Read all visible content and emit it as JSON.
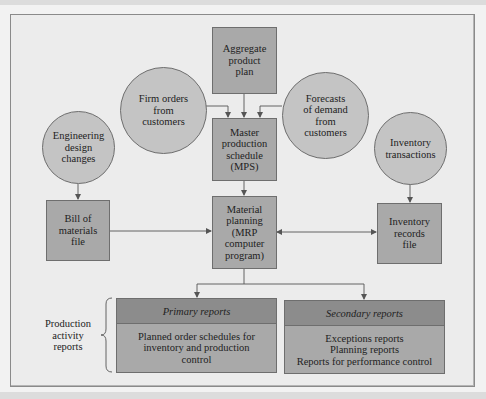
{
  "diagram": {
    "nodes": {
      "aggregate_plan": {
        "label": "Aggregate\nproduct\nplan",
        "shape": "rectangle"
      },
      "firm_orders": {
        "label": "Firm orders\nfrom\ncustomers",
        "shape": "circle"
      },
      "forecasts": {
        "label": "Forecasts\nof demand\nfrom\ncustomers",
        "shape": "circle"
      },
      "mps": {
        "label": "Master\nproduction\nschedule\n(MPS)",
        "shape": "rectangle"
      },
      "engineering_changes": {
        "label": "Engineering\ndesign\nchanges",
        "shape": "circle"
      },
      "inventory_transactions": {
        "label": "Inventory\ntransactions",
        "shape": "circle"
      },
      "bill_of_materials": {
        "label": "Bill of\nmaterials\nfile",
        "shape": "rectangle"
      },
      "material_planning": {
        "label": "Material\nplanning\n(MRP\ncomputer\nprogram)",
        "shape": "rectangle"
      },
      "inventory_records": {
        "label": "Inventory\nrecords\nfile",
        "shape": "rectangle"
      }
    },
    "reports": {
      "group_label": "Production\nactivity\nreports",
      "primary": {
        "title": "Primary reports",
        "body": "Planned order schedules for\ninventory and production\ncontrol"
      },
      "secondary": {
        "title": "Secondary reports",
        "body": "Exceptions reports\nPlanning reports\nReports for performance control"
      }
    },
    "edges": [
      {
        "from": "aggregate_plan",
        "to": "mps"
      },
      {
        "from": "firm_orders",
        "to": "mps"
      },
      {
        "from": "forecasts",
        "to": "mps"
      },
      {
        "from": "mps",
        "to": "material_planning"
      },
      {
        "from": "engineering_changes",
        "to": "bill_of_materials"
      },
      {
        "from": "bill_of_materials",
        "to": "material_planning"
      },
      {
        "from": "inventory_transactions",
        "to": "inventory_records"
      },
      {
        "from": "material_planning",
        "to": "inventory_records",
        "bidirectional": true
      },
      {
        "from": "material_planning",
        "to": "primary_reports"
      },
      {
        "from": "material_planning",
        "to": "secondary_reports"
      }
    ],
    "colors": {
      "box_fill": "#a9a9a9",
      "circle_fill": "#c4c4c4",
      "header_fill": "#8c8c8c",
      "background": "#ececec",
      "line": "#555555"
    }
  }
}
